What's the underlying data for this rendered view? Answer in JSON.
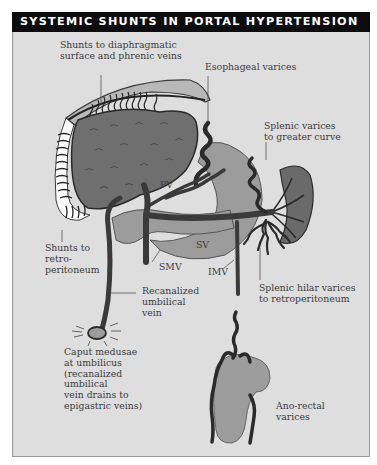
{
  "figure": {
    "title": "SYSTEMIC SHUNTS IN PORTAL HYPERTENSION",
    "colors": {
      "title_bar": "#0c0c0c",
      "title_text": "#ffffff",
      "panel_bg": "#dedede",
      "organ_dark": "#6f6f6f",
      "organ_light": "#9c9c9c",
      "vein": "#3a3a3a",
      "label_text": "#3a3a3a"
    }
  },
  "labels": {
    "diaphragm": "Shunts to diaphragmatic\nsurface and phrenic veins",
    "esophageal": "Esophageal varices",
    "splenic_greater": "Splenic varices\nto greater curve",
    "pv": "PV",
    "sv": "SV",
    "smv": "SMV",
    "imv": "IMV",
    "retroperitoneum": "Shunts to\nretro-\nperitoneum",
    "recanalized": "Recanalized\numbilical\nvein",
    "splenic_hilar": "Splenic hilar varices\nto retroperitoneum",
    "caput": "Caput medusae\nat umbilicus\n(recanalized\numbilical\nvein drains to\nepigastric veins)",
    "anorectal": "Ano-rectal\nvarices"
  }
}
